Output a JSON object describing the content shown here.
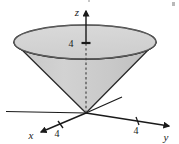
{
  "figure": {
    "type": "3d-cone-diagram",
    "title": "",
    "background_color": "#ffffff",
    "width": 179,
    "height": 144
  },
  "axes": {
    "z": {
      "label": "z",
      "label_x": 77,
      "label_y": 13,
      "arrow_tip": [
        86,
        9
      ],
      "origin": [
        86,
        113
      ],
      "direction": "up",
      "style": "solid-above-rim-dashed-inside-cone"
    },
    "x": {
      "label": "x",
      "label_x": 31,
      "label_y": 137,
      "arrow_tip": [
        38,
        133
      ],
      "origin": [
        86,
        113
      ],
      "direction": "down-left",
      "negative_extension_tip": [
        122,
        97
      ]
    },
    "y": {
      "label": "y",
      "label_x": 165,
      "label_y": 138,
      "arrow_tip": [
        172,
        127
      ],
      "origin": [
        86,
        113
      ],
      "direction": "down-right",
      "negative_extension_tip": [
        6,
        111
      ]
    }
  },
  "ticks": [
    {
      "axis": "z",
      "value": "4",
      "label_x": 70,
      "label_y": 47,
      "mark_x": 86,
      "mark_y": 43
    },
    {
      "axis": "x",
      "value": "4",
      "label_x": 55,
      "label_y": 135,
      "mark_x": 61,
      "mark_y": 126
    },
    {
      "axis": "y",
      "value": "4",
      "label_x": 136,
      "label_y": 132,
      "mark_x": 138,
      "mark_y": 122
    }
  ],
  "cone": {
    "shape": "circular-cone-opening-upward",
    "vertex": [
      86,
      113
    ],
    "rim_center": [
      85,
      42
    ],
    "rim_radius_x": 71,
    "rim_radius_y": 17,
    "top_face_fill": "#d4d4d4",
    "body_fill": "#c9c9c9",
    "outline_color": "#2a2a2a",
    "outline_width": 1.4
  },
  "colors": {
    "ink": "#1a1a1a",
    "cone_light": "#d6d6d6",
    "cone_mid": "#cbcbcb",
    "cone_dark": "#bdbdbd",
    "outline": "#2a2a2a",
    "background": "#ffffff"
  },
  "artifacts": [
    {
      "name": "scan-speck-top-right",
      "x": 172,
      "y": 2,
      "w": 3,
      "h": 4
    },
    {
      "name": "scan-speck-top-middle",
      "x": 88,
      "y": 0,
      "w": 2,
      "h": 2
    }
  ]
}
